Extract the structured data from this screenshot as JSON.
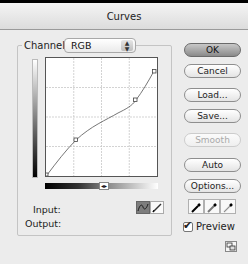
{
  "window": {
    "title": "Curves"
  },
  "channel": {
    "label": "Channel:",
    "value": "RGB"
  },
  "graph": {
    "grid_divisions": 4,
    "curve_points": [
      {
        "input": 0,
        "output": 0
      },
      {
        "input": 64,
        "output": 84
      },
      {
        "input": 191,
        "output": 160
      },
      {
        "input": 255,
        "output": 230
      }
    ]
  },
  "readout": {
    "input_label": "Input:",
    "output_label": "Output:"
  },
  "modes": {
    "curve": "curve-mode",
    "pencil": "pencil-mode",
    "active": "curve"
  },
  "buttons": {
    "ok": "OK",
    "cancel": "Cancel",
    "load": "Load...",
    "save": "Save...",
    "smooth": "Smooth",
    "auto": "Auto",
    "options": "Options..."
  },
  "eyedroppers": [
    "black-point",
    "gray-point",
    "white-point"
  ],
  "preview": {
    "label": "Preview",
    "checked": true,
    "check_glyph": "✔"
  },
  "icons": {
    "toggle_arrows": "◂▸",
    "stepper": "▴▾"
  }
}
